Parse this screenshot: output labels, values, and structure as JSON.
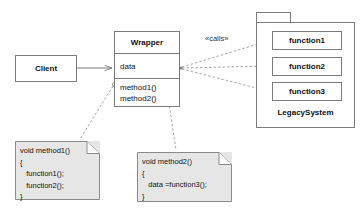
{
  "diagram": {
    "type": "uml-class-diagram",
    "colors": {
      "line": "#7b7b7b",
      "note_fill": "#e6e6e6",
      "box_fill": "#ffffff",
      "text": "#111111",
      "background": "#ffffff"
    }
  },
  "client": {
    "label": "Client"
  },
  "wrapper": {
    "name": "Wrapper",
    "attributes": [
      "data"
    ],
    "operations": [
      "method1()",
      "method2()"
    ]
  },
  "legacy_system": {
    "package_label": "LegacySystem",
    "functions": [
      {
        "label": "function1"
      },
      {
        "label": "function2"
      },
      {
        "label": "function3"
      }
    ]
  },
  "relations": {
    "client_to_wrapper": {
      "style": "solid",
      "arrow": "open"
    },
    "calls_stereotype": "«calls»",
    "wrapper_to_functions": {
      "style": "dashed",
      "arrow": "open",
      "count": 3
    }
  },
  "notes": [
    {
      "anchor": "method1()",
      "lines": [
        "void method1()",
        "{",
        "   function1();",
        "   function2();",
        "}"
      ]
    },
    {
      "anchor": "method2()",
      "lines": [
        "void method2()",
        "{",
        "   data =function3();",
        "}"
      ]
    }
  ]
}
